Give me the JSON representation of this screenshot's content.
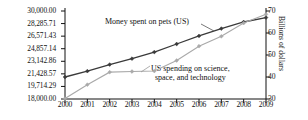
{
  "chart_data": {
    "type": "line",
    "title": "",
    "x": [
      2000,
      2001,
      2002,
      2003,
      2004,
      2005,
      2006,
      2007,
      2008,
      2009
    ],
    "xlabel": "",
    "xtick_labels": [
      "2000",
      "2001",
      "2002",
      "2003",
      "2004",
      "2005",
      "2006",
      "2007",
      "2008",
      "2009"
    ],
    "grid": false,
    "legend_position": "inline-annotations",
    "axes": {
      "left": {
        "label": "",
        "ylim": [
          18000.0,
          30000.0
        ],
        "ticks": [
          18000.0,
          19714.29,
          21428.57,
          23142.86,
          24857.14,
          26571.43,
          28285.71,
          30000.0
        ],
        "tick_labels": [
          "18,000.00",
          "19,714.29",
          "21,428.57",
          "23,142.86",
          "24,857.14",
          "26,571.43",
          "28,285.71",
          "30,000.00"
        ]
      },
      "right": {
        "label": "Billions of dollars",
        "ylim": [
          30,
          70
        ],
        "ticks": [
          30,
          40,
          50,
          60,
          70
        ],
        "tick_labels": [
          "30",
          "40",
          "50",
          "60",
          "70"
        ]
      }
    },
    "series": [
      {
        "name": "Money spent on pets (US)",
        "axis": "left",
        "color": "#3a3a3a",
        "marker": "diamond",
        "values": [
          21000,
          21800,
          22700,
          23500,
          24400,
          25500,
          26600,
          27600,
          28500,
          29100
        ]
      },
      {
        "name": "US spending on science, space, and technology",
        "axis": "right",
        "color": "#a9a9a9",
        "marker": "diamond",
        "values": [
          30.2,
          36.5,
          42.2,
          42.5,
          42.7,
          47.5,
          54.0,
          58.5,
          64.5,
          68.5
        ]
      }
    ],
    "annotations": [
      {
        "text": "Money spent on pets (US)",
        "series": 0
      },
      {
        "text": "US spending on science,",
        "series": 1
      },
      {
        "text": "space, and technology",
        "series": 1
      }
    ]
  }
}
